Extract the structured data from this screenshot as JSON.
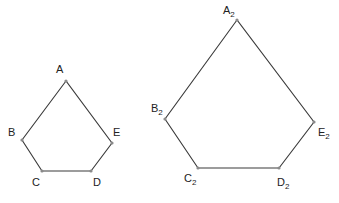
{
  "colors": {
    "stroke": "#3a3a3a",
    "vertex": "#8a8a8a",
    "label": "#222222",
    "background": "#ffffff"
  },
  "figures": [
    {
      "name": "small-pentagon",
      "vertices": [
        {
          "label": "A",
          "sub": "",
          "x": 66,
          "y": 81,
          "lx": 56,
          "ly": 73
        },
        {
          "label": "B",
          "sub": "",
          "x": 22,
          "y": 140,
          "lx": 8,
          "ly": 136
        },
        {
          "label": "C",
          "sub": "",
          "x": 42,
          "y": 171,
          "lx": 32,
          "ly": 186
        },
        {
          "label": "D",
          "sub": "",
          "x": 91,
          "y": 171,
          "lx": 93,
          "ly": 186
        },
        {
          "label": "E",
          "sub": "",
          "x": 112,
          "y": 143,
          "lx": 113,
          "ly": 136
        }
      ]
    },
    {
      "name": "large-pentagon",
      "vertices": [
        {
          "label": "A",
          "sub": "2",
          "x": 237,
          "y": 20,
          "lx": 223,
          "ly": 14
        },
        {
          "label": "B",
          "sub": "2",
          "x": 165,
          "y": 119,
          "lx": 151,
          "ly": 112
        },
        {
          "label": "C",
          "sub": "2",
          "x": 198,
          "y": 168,
          "lx": 184,
          "ly": 182
        },
        {
          "label": "D",
          "sub": "2",
          "x": 279,
          "y": 168,
          "lx": 277,
          "ly": 186
        },
        {
          "label": "E",
          "sub": "2",
          "x": 314,
          "y": 122,
          "lx": 318,
          "ly": 136
        }
      ]
    }
  ]
}
